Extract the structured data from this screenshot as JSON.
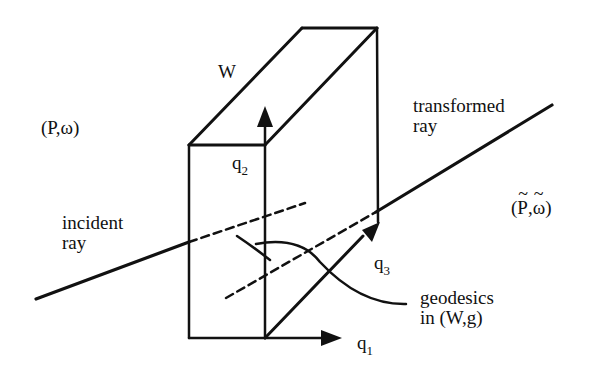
{
  "diagram": {
    "labels": {
      "W": "W",
      "source_space": "(P,ω)",
      "target_space_open": "(",
      "target_space_P": "P",
      "target_space_comma": ",",
      "target_space_omega": "ω",
      "target_space_close": ")",
      "tilde": "~",
      "q1": "q",
      "q1_sub": "1",
      "q2": "q",
      "q2_sub": "2",
      "q3": "q",
      "q3_sub": "3",
      "incident_line1": "incident",
      "incident_line2": "ray",
      "transformed_line1": "transformed",
      "transformed_line2": "ray",
      "geodesics_line1": "geodesics",
      "geodesics_line2": "in (W,g)"
    },
    "colors": {
      "ink": "#111111",
      "background": "#ffffff"
    }
  }
}
